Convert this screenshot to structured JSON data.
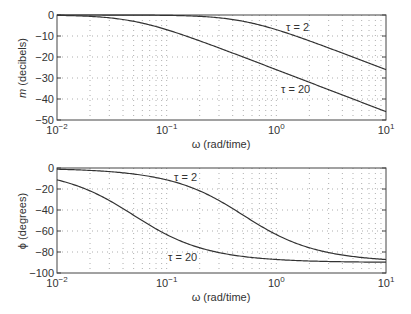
{
  "chart_data": [
    {
      "type": "line",
      "title": "",
      "xlabel": "ω (rad/time)",
      "ylabel": "m (decibels)",
      "xscale": "log",
      "xlim": [
        0.01,
        10
      ],
      "ylim": [
        -50,
        0
      ],
      "xticks": [
        "10^-2",
        "10^-1",
        "10^0",
        "10^1"
      ],
      "yticks": [
        "0",
        "-10",
        "-20",
        "-30",
        "-40",
        "-50"
      ],
      "grid": true,
      "series": [
        {
          "name": "τ = 2",
          "x": [
            0.01,
            0.05,
            0.1,
            0.2,
            0.5,
            1,
            2,
            5,
            10
          ],
          "values": [
            0.0,
            -0.04,
            -0.17,
            -0.64,
            -3.0,
            -6.99,
            -12.3,
            -20.0,
            -26.0
          ]
        },
        {
          "name": "τ = 20",
          "x": [
            0.01,
            0.02,
            0.05,
            0.1,
            0.2,
            0.5,
            1,
            2,
            5,
            10
          ],
          "values": [
            -0.17,
            -0.64,
            -3.0,
            -6.99,
            -12.3,
            -20.0,
            -26.0,
            -32.0,
            -40.0,
            -46.0
          ]
        }
      ],
      "annotations": [
        {
          "text": "τ = 2",
          "x": 0.9,
          "y": -4
        },
        {
          "text": "τ = 20",
          "x": 0.8,
          "y": -36
        }
      ]
    },
    {
      "type": "line",
      "title": "",
      "xlabel": "ω (rad/time)",
      "ylabel": "ϕ (degrees)",
      "xscale": "log",
      "xlim": [
        0.01,
        10
      ],
      "ylim": [
        -100,
        0
      ],
      "xticks": [
        "10^-2",
        "10^-1",
        "10^0",
        "10^1"
      ],
      "yticks": [
        "0",
        "-20",
        "-40",
        "-60",
        "-80",
        "-100"
      ],
      "grid": true,
      "series": [
        {
          "name": "τ = 2",
          "x": [
            0.01,
            0.05,
            0.1,
            0.2,
            0.5,
            1,
            2,
            5,
            10
          ],
          "values": [
            -1.1,
            -5.7,
            -11.3,
            -21.8,
            -45.0,
            -63.4,
            -76.0,
            -84.3,
            -87.1
          ]
        },
        {
          "name": "τ = 20",
          "x": [
            0.01,
            0.02,
            0.05,
            0.1,
            0.2,
            0.5,
            1,
            2,
            5,
            10
          ],
          "values": [
            -11.3,
            -21.8,
            -45.0,
            -63.4,
            -76.0,
            -84.3,
            -87.1,
            -88.6,
            -89.4,
            -89.7
          ]
        }
      ],
      "annotations": [
        {
          "text": "τ = 2",
          "x": 0.12,
          "y": -8
        },
        {
          "text": "τ = 20",
          "x": 0.1,
          "y": -85
        }
      ]
    }
  ],
  "top": {
    "ylabel_var": "m",
    "ylabel_unit": " (decibels)",
    "xlabel": "ω (rad/time)",
    "yticks": [
      "0",
      "−10",
      "−20",
      "−30",
      "−40",
      "−50"
    ],
    "label_tau2": "τ = 2",
    "label_tau20": "τ = 20"
  },
  "bottom": {
    "ylabel_var": "ϕ",
    "ylabel_unit": " (degrees)",
    "xlabel": "ω (rad/time)",
    "yticks": [
      "0",
      "−20",
      "−40",
      "−60",
      "−80",
      "−100"
    ],
    "label_tau2": "τ = 2",
    "label_tau20": "τ = 20"
  },
  "xticks": [
    {
      "base": "10",
      "exp": "−2"
    },
    {
      "base": "10",
      "exp": "−1"
    },
    {
      "base": "10",
      "exp": "0"
    },
    {
      "base": "10",
      "exp": "1"
    }
  ],
  "colors": {
    "axis": "#444444",
    "curve": "#333333",
    "grid": "#9a9a9a"
  }
}
